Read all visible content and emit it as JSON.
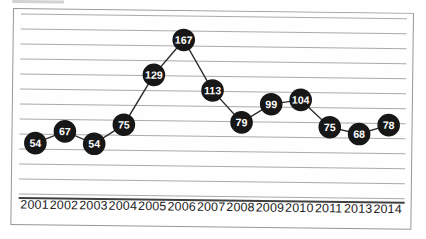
{
  "chart_data": {
    "type": "line",
    "categories": [
      "2001",
      "2002",
      "2003",
      "2004",
      "2005",
      "2006",
      "2007",
      "2008",
      "2009",
      "2010",
      "2011",
      "2013",
      "2014"
    ],
    "values": [
      54,
      67,
      54,
      75,
      129,
      167,
      113,
      79,
      99,
      104,
      75,
      68,
      78
    ],
    "title": "",
    "xlabel": "",
    "ylabel": "",
    "ylim": [
      0,
      195
    ],
    "grid": true,
    "gridline_count": 13,
    "legend": "none",
    "data_labels": "inside-marker",
    "marker_style": {
      "shape": "circle",
      "fill": "#171717",
      "text_color": "#ffffff"
    },
    "line_color": "#2b2b2b"
  },
  "colors": {
    "background": "#ffffff",
    "plot_background": "#fefefe",
    "frame_border": "#979797",
    "gridline": "#aaaaaa",
    "axis_line": "#404040",
    "label": "#1b1b1b"
  }
}
